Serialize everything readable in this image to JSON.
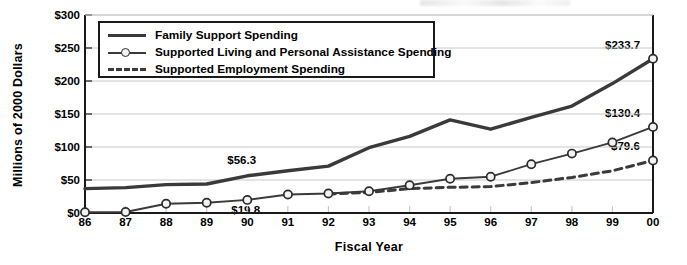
{
  "chart_data": {
    "type": "line",
    "title": "",
    "xlabel": "Fiscal Year",
    "ylabel": "Millions of 2000 Dollars",
    "categories": [
      "86",
      "87",
      "88",
      "89",
      "90",
      "91",
      "92",
      "93",
      "94",
      "95",
      "96",
      "97",
      "98",
      "99",
      "00"
    ],
    "x_tick_labels": [
      "86",
      "87",
      "88",
      "89",
      "90",
      "91",
      "92",
      "93",
      "94",
      "95",
      "96",
      "97",
      "98",
      "99",
      "00"
    ],
    "y_tick_labels": [
      "$0",
      "$50",
      "$100",
      "$150",
      "$200",
      "$250",
      "$300"
    ],
    "y_tick_values": [
      0,
      50,
      100,
      150,
      200,
      250,
      300
    ],
    "ylim": [
      0,
      300
    ],
    "grid": true,
    "legend_position": "top-left",
    "series": [
      {
        "name": "Family Support Spending",
        "style": "solid-thick",
        "values": [
          37.0,
          38.5,
          43.0,
          44.0,
          56.3,
          64.0,
          71.0,
          99.0,
          116.0,
          141.0,
          127.0,
          145.0,
          162.0,
          196.0,
          233.7
        ]
      },
      {
        "name": "Supported Living and Personal Assistance Spending",
        "style": "solid-marker",
        "values": [
          1.0,
          1.5,
          14.0,
          15.5,
          19.8,
          28.0,
          29.5,
          33.0,
          42.0,
          52.0,
          55.0,
          74.0,
          90.0,
          107.0,
          130.4
        ]
      },
      {
        "name": "Supported Employment Spending",
        "style": "dashed",
        "values": [
          null,
          null,
          null,
          null,
          null,
          null,
          29.0,
          31.0,
          37.0,
          39.0,
          40.0,
          46.0,
          54.0,
          64.0,
          79.6
        ]
      }
    ],
    "annotations": [
      {
        "label": "$56.3",
        "series": "Family Support Spending",
        "x": "90",
        "value": 56.3
      },
      {
        "label": "$19.8",
        "series": "Supported Living and Personal Assistance Spending",
        "x": "90",
        "value": 19.8
      },
      {
        "label": "$233.7",
        "series": "Family Support Spending",
        "x": "00",
        "value": 233.7
      },
      {
        "label": "$130.4",
        "series": "Supported Living and Personal Assistance Spending",
        "x": "00",
        "value": 130.4
      },
      {
        "label": "$79.6",
        "series": "Supported Employment Spending",
        "x": "00",
        "value": 79.6
      }
    ],
    "colors": {
      "line": "#3a3a3a",
      "marker_fill": "#f2f2f2",
      "marker_stroke": "#2b2b2b",
      "axis": "#1a1a1a",
      "grid": "#c8c8c8",
      "background": "#ffffff"
    }
  },
  "legend": {
    "items": [
      {
        "label": "Family Support Spending"
      },
      {
        "label": "Supported Living and Personal Assistance Spending"
      },
      {
        "label": "Supported Employment Spending"
      }
    ]
  },
  "axes": {
    "y_title": "Millions of 2000 Dollars",
    "x_title": "Fiscal Year"
  }
}
